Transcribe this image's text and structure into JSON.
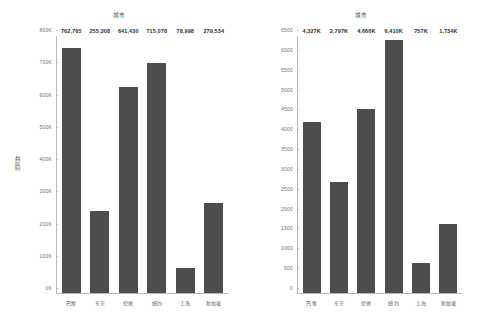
{
  "chart_data": [
    {
      "type": "bar",
      "panel": "left",
      "title": "城市",
      "xlabel": "",
      "ylabel": "居民数",
      "categories": [
        "巴黎",
        "东京",
        "伦敦",
        "纽约",
        "上海",
        "新加坡"
      ],
      "values": [
        762765,
        255308,
        641430,
        715078,
        78998,
        279534
      ],
      "value_labels": [
        "762,765",
        "255,308",
        "641,430",
        "715,078",
        "78,998",
        "279,534"
      ],
      "ylim": [
        0,
        800000
      ],
      "yticks": [
        0,
        100000,
        200000,
        300000,
        400000,
        500000,
        600000,
        700000,
        800000
      ],
      "ytick_labels": [
        "0K",
        "100K",
        "200K",
        "300K",
        "400K",
        "500K",
        "600K",
        "700K",
        "800K"
      ],
      "grid": false,
      "legend": "none",
      "bar_color": "#4d4d4d"
    },
    {
      "type": "bar",
      "panel": "right",
      "title": "城市",
      "xlabel": "",
      "ylabel": "Total",
      "categories": [
        "巴黎",
        "东京",
        "伦敦",
        "纽约",
        "上海",
        "新加坡"
      ],
      "values": [
        4327,
        2797,
        4666,
        6410,
        757,
        1734
      ],
      "value_labels": [
        "4,327K",
        "2,797K",
        "4,666K",
        "6,410K",
        "757K",
        "1,734K"
      ],
      "ylim": [
        0,
        6500
      ],
      "yticks": [
        0,
        500,
        1000,
        1500,
        2000,
        2500,
        3000,
        3500,
        4000,
        4500,
        5000,
        5500,
        6000,
        6500
      ],
      "ytick_labels": [
        "0",
        "500",
        "1000",
        "1500",
        "2000",
        "2500",
        "3000",
        "3500",
        "4000",
        "4500",
        "5000",
        "5500",
        "6000",
        "6500"
      ],
      "grid": false,
      "legend": "none",
      "bar_color": "#4d4d4d"
    }
  ]
}
